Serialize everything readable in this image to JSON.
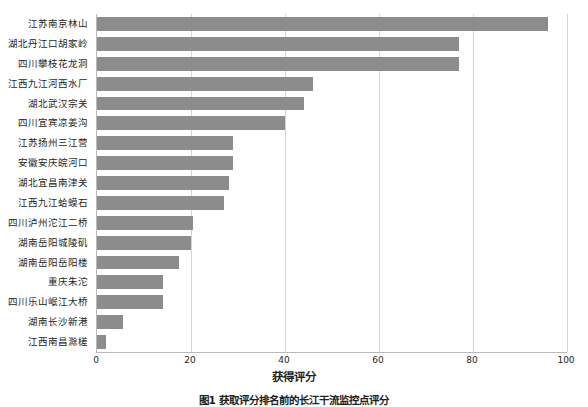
{
  "chart_data": {
    "type": "bar",
    "orientation": "horizontal",
    "title": "",
    "xlabel": "获得评分",
    "ylabel": "",
    "xlim": [
      0,
      100
    ],
    "xticks": [
      0,
      20,
      40,
      60,
      80,
      100
    ],
    "grid": "vertical",
    "legend": "none",
    "bar_color": "#8c8c8c",
    "categories": [
      "江苏南京林山",
      "湖北丹江口胡家岭",
      "四川攀枝花龙洞",
      "江西九江河西水厂",
      "湖北武汉宗关",
      "四川宜宾凉姜沟",
      "江苏扬州三江营",
      "安徽安庆皖河口",
      "湖北宜昌南津关",
      "江西九江蛤蟆石",
      "四川泸州沱江二桥",
      "湖南岳阳城陵矶",
      "湖南岳阳岳阳楼",
      "重庆朱沱",
      "四川乐山岷江大桥",
      "湖南长沙新港",
      "江西南昌滁槎"
    ],
    "values": [
      96,
      77,
      77,
      46,
      44,
      40,
      29,
      29,
      28,
      27,
      20.5,
      20,
      17.5,
      14,
      14,
      5.5,
      2
    ],
    "caption": "图1  获取评分排名前的长江干流监控点评分"
  },
  "axis": {
    "x_tick_labels": [
      "0",
      "20",
      "40",
      "60",
      "80",
      "100"
    ],
    "x_axis_title": "获得评分"
  }
}
